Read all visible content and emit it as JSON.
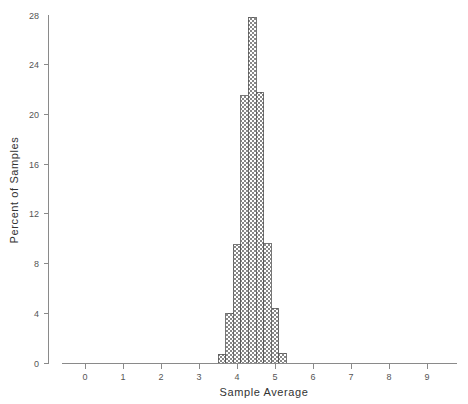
{
  "chart_data": {
    "type": "bar",
    "title": "",
    "subtitle": "",
    "xlabel": "Sample Average",
    "ylabel": "Percent of Samples",
    "xlim": [
      -0.6,
      9.8
    ],
    "ylim": [
      0,
      28
    ],
    "grid": false,
    "legend": null,
    "xticks": [
      0,
      1,
      2,
      3,
      4,
      5,
      6,
      7,
      8,
      9
    ],
    "xtick_labels": [
      "0",
      "1",
      "2",
      "3",
      "4",
      "5",
      "6",
      "7",
      "8",
      "9"
    ],
    "yticks": [
      0,
      4,
      8,
      12,
      16,
      20,
      24,
      28
    ],
    "ytick_labels": [
      "0",
      "4",
      "8",
      "12",
      "16",
      "20",
      "24",
      "28"
    ],
    "bin_width": 0.2,
    "bin_left_edges": [
      3.5,
      3.7,
      3.9,
      4.1,
      4.3,
      4.5,
      4.7,
      4.9,
      5.1
    ],
    "categories": [
      "3.5-3.7",
      "3.7-3.9",
      "3.9-4.1",
      "4.1-4.3",
      "4.3-4.5",
      "4.5-4.7",
      "4.7-4.9",
      "4.9-5.1",
      "5.1-5.3"
    ],
    "values": [
      0.7,
      4.0,
      9.5,
      21.5,
      27.8,
      21.8,
      9.6,
      4.4,
      0.8
    ],
    "bar_fill_pattern": "checkerboard",
    "bar_fill_color": "#808080",
    "bar_edge_color": "#555555"
  },
  "axis": {
    "x_title": "Sample Average",
    "y_title": "Percent of Samples"
  },
  "colors": {
    "axis": "#8a8a8a",
    "text": "#555555",
    "background": "#ffffff"
  }
}
